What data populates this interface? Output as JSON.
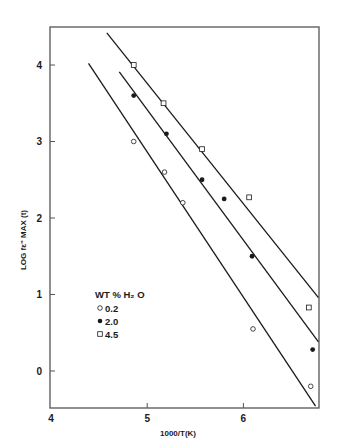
{
  "chart_data": {
    "type": "scatter",
    "title": "",
    "xlabel": "1000/T(K)",
    "ylabel": "LOG fε\" MAX (t)",
    "xlim": [
      4,
      6.8
    ],
    "ylim": [
      -0.5,
      4.5
    ],
    "x_ticks": [
      4,
      5,
      6
    ],
    "y_ticks": [
      0,
      1,
      2,
      3,
      4
    ],
    "grid": false,
    "legend": {
      "title": "WT % H₂ O",
      "position": "lower-left-inside",
      "entries": [
        {
          "label": "0.2",
          "marker": "open-circle"
        },
        {
          "label": "2.0",
          "marker": "filled-circle"
        },
        {
          "label": "4.5",
          "marker": "open-square"
        }
      ]
    },
    "series": [
      {
        "name": "0.2",
        "marker": "open-circle",
        "points": [
          {
            "x": 4.86,
            "y": 3.0
          },
          {
            "x": 5.18,
            "y": 2.6
          },
          {
            "x": 5.37,
            "y": 2.2
          },
          {
            "x": 6.1,
            "y": 0.55
          },
          {
            "x": 6.7,
            "y": -0.2
          }
        ],
        "fit_line": {
          "x0": 4.39,
          "y0": 4.02,
          "x1": 6.75,
          "y1": -0.46
        }
      },
      {
        "name": "2.0",
        "marker": "filled-circle",
        "points": [
          {
            "x": 4.86,
            "y": 3.6
          },
          {
            "x": 5.2,
            "y": 3.1
          },
          {
            "x": 5.57,
            "y": 2.5
          },
          {
            "x": 5.8,
            "y": 2.25
          },
          {
            "x": 6.09,
            "y": 1.5
          },
          {
            "x": 6.72,
            "y": 0.28
          }
        ],
        "fit_line": {
          "x0": 4.71,
          "y0": 3.91,
          "x1": 6.78,
          "y1": 0.38
        }
      },
      {
        "name": "4.5",
        "marker": "open-square",
        "points": [
          {
            "x": 4.86,
            "y": 4.0
          },
          {
            "x": 5.17,
            "y": 3.5
          },
          {
            "x": 5.57,
            "y": 2.9
          },
          {
            "x": 6.06,
            "y": 2.27
          },
          {
            "x": 6.68,
            "y": 0.83
          }
        ],
        "fit_line": {
          "x0": 4.58,
          "y0": 4.42,
          "x1": 6.78,
          "y1": 0.96
        }
      }
    ]
  },
  "axes": {
    "x_tick_labels": [
      "4",
      "5",
      "6"
    ],
    "y_tick_labels": [
      "0",
      "1",
      "2",
      "3",
      "4"
    ],
    "x_title": "1000/T(K)",
    "y_title": "LOG fε\" MAX (t)"
  },
  "legend": {
    "title": "WT % H₂ O",
    "items": [
      {
        "label": "0.2"
      },
      {
        "label": "2.0"
      },
      {
        "label": "4.5"
      }
    ]
  },
  "colors": {
    "ink": "#1a1a1a",
    "frame": "#555555",
    "background": "#ffffff"
  }
}
